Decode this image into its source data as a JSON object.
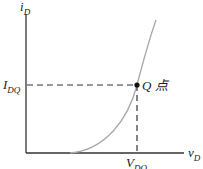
{
  "diagram": {
    "type": "diode-iv-characteristic",
    "y_axis_label": "i",
    "y_axis_sub": "D",
    "x_axis_label": "v",
    "x_axis_sub": "D",
    "idq_label": "I",
    "idq_sub": "DQ",
    "vdq_label": "V",
    "vdq_sub": "DQ",
    "q_point_label": "Q 点",
    "colors": {
      "axis": "#333333",
      "curve": "#a8a8a8",
      "dashed": "#333333",
      "point": "#111111"
    }
  }
}
